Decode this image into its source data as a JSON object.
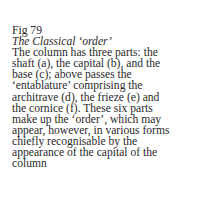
{
  "caption": {
    "figure_label": "Fig 79",
    "title": "The Classical ‘order’",
    "body_lines": [
      "The column has three parts: the",
      "shaft (a), the capital (b), and the",
      "base (c); above passes the",
      "‘entablature’ comprising the",
      "architrave (d), the frieze (e) and",
      "the cornice (f). These six parts",
      "make up the ‘order’, which may",
      "appear, however, in various forms",
      "chiefly recognisable by the",
      "appearance of the capital of the",
      "column"
    ]
  }
}
